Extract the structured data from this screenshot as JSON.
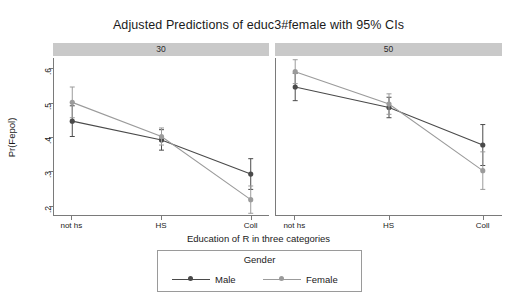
{
  "chart_data": {
    "type": "line",
    "title": "Adjusted Predictions of educ3#female with 95% CIs",
    "xlabel": "Education of R in three categories",
    "ylabel": "Pr(Fepol)",
    "categories": [
      "not hs",
      "HS",
      "Coll"
    ],
    "ylim": [
      0.17,
      0.63
    ],
    "yticks": [
      ".2",
      ".3",
      ".4",
      ".5",
      ".6"
    ],
    "ytick_values": [
      0.2,
      0.3,
      0.4,
      0.5,
      0.6
    ],
    "grid": false,
    "legend_position": "bottom",
    "legend_title": "Gender",
    "panel_variable": "age",
    "panels": [
      {
        "label": "30",
        "series": [
          {
            "name": "Male",
            "color": "#4a4a4a",
            "marker": "circle-filled",
            "values": [
              0.445,
              0.39,
              0.29
            ],
            "ci_lower": [
              0.4,
              0.36,
              0.245
            ],
            "ci_upper": [
              0.49,
              0.42,
              0.335
            ]
          },
          {
            "name": "Female",
            "color": "#9b9b9b",
            "marker": "circle-filled",
            "values": [
              0.5,
              0.4,
              0.215
            ],
            "ci_lower": [
              0.455,
              0.375,
              0.175
            ],
            "ci_upper": [
              0.545,
              0.425,
              0.255
            ]
          }
        ]
      },
      {
        "label": "50",
        "series": [
          {
            "name": "Male",
            "color": "#4a4a4a",
            "marker": "circle-filled",
            "values": [
              0.545,
              0.485,
              0.375
            ],
            "ci_lower": [
              0.505,
              0.455,
              0.315
            ],
            "ci_upper": [
              0.585,
              0.515,
              0.435
            ]
          },
          {
            "name": "Female",
            "color": "#9b9b9b",
            "marker": "circle-filled",
            "values": [
              0.59,
              0.495,
              0.3
            ],
            "ci_lower": [
              0.555,
              0.465,
              0.245
            ],
            "ci_upper": [
              0.625,
              0.525,
              0.355
            ]
          }
        ]
      }
    ]
  },
  "legend": {
    "title": "Gender",
    "entries": [
      {
        "label": "Male",
        "color": "#4a4a4a"
      },
      {
        "label": "Female",
        "color": "#9b9b9b"
      }
    ]
  },
  "axes": {
    "y_label": "Pr(Fepol)",
    "x_label": "Education of R in three categories",
    "y_ticks": [
      ".6",
      ".5",
      ".4",
      ".3",
      ".2"
    ],
    "x_ticks": [
      "not hs",
      "HS",
      "Coll"
    ]
  },
  "panel_headers": [
    "30",
    "50"
  ],
  "title": "Adjusted Predictions of educ3#female with 95% CIs",
  "colors": {
    "male": "#4a4a4a",
    "female": "#9b9b9b",
    "panel_strip": "#c9c9c9",
    "axis": "#7a7a7a",
    "background": "#ffffff"
  }
}
